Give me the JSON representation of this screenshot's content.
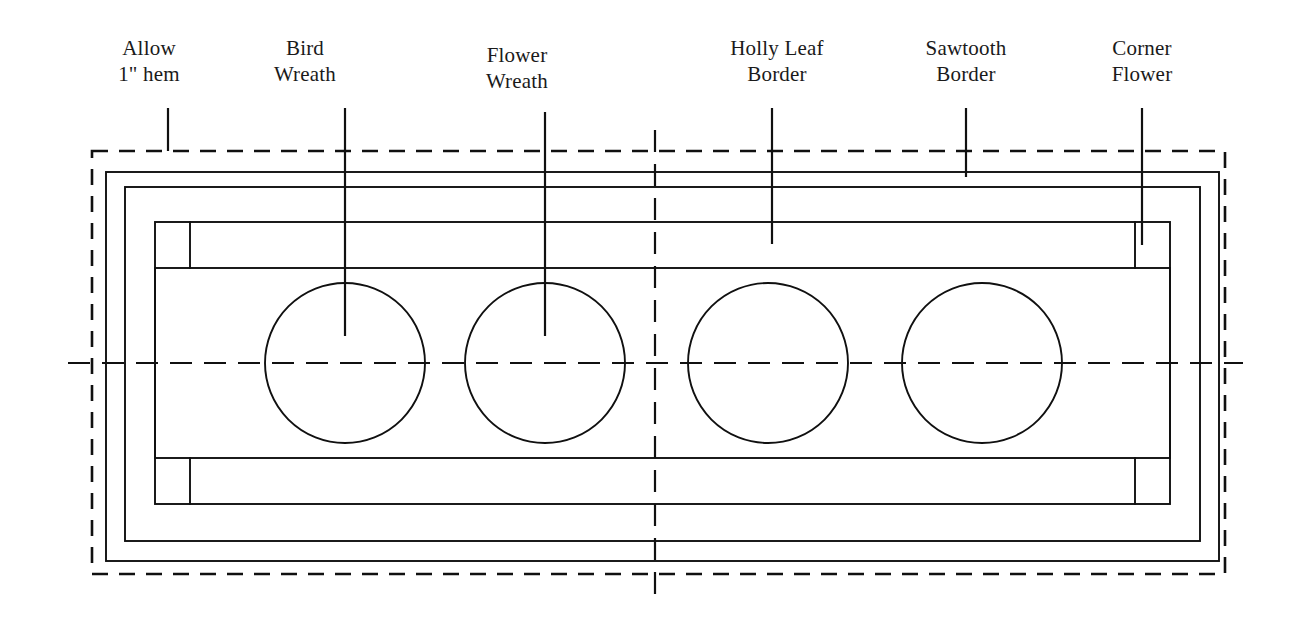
{
  "figure": {
    "kind": "quilt-layout-diagram",
    "background_color": "#ffffff",
    "ink_color": "#101010",
    "width": 1310,
    "height": 619
  },
  "callouts": [
    {
      "id": "allow-hem",
      "line1": "Allow",
      "line2": "1\" hem",
      "text_x": 149,
      "text_y": 55,
      "leader_x": 168,
      "leader_top": 108,
      "leader_bottom": 151
    },
    {
      "id": "bird-wreath",
      "line1": "Bird",
      "line2": "Wreath",
      "text_x": 305,
      "text_y": 55,
      "leader_x": 345,
      "leader_top": 108,
      "leader_bottom": 336
    },
    {
      "id": "flower-wreath",
      "line1": "Flower",
      "line2": "Wreath",
      "text_x": 517,
      "text_y": 62,
      "leader_x": 545,
      "leader_top": 112,
      "leader_bottom": 336
    },
    {
      "id": "holly-leaf-border",
      "line1": "Holly Leaf",
      "line2": "Border",
      "text_x": 777,
      "text_y": 55,
      "leader_x": 772,
      "leader_top": 108,
      "leader_bottom": 244
    },
    {
      "id": "sawtooth-border",
      "line1": "Sawtooth",
      "line2": "Border",
      "text_x": 966,
      "text_y": 55,
      "leader_x": 966,
      "leader_top": 108,
      "leader_bottom": 177
    },
    {
      "id": "corner-flower",
      "line1": "Corner",
      "line2": "Flower",
      "text_x": 1142,
      "text_y": 55,
      "leader_x": 1142,
      "leader_top": 108,
      "leader_bottom": 245
    }
  ],
  "hem_border": {
    "name": "allow-1-inch-hem-dashed-border",
    "x": 92,
    "y": 151,
    "width": 1133,
    "height": 423
  },
  "rectangles": [
    {
      "id": "outer-binding",
      "x": 106,
      "y": 172,
      "width": 1113,
      "height": 389
    },
    {
      "id": "sawtooth-border-band",
      "x": 125,
      "y": 187,
      "width": 1075,
      "height": 354
    },
    {
      "id": "holly-leaf-border-band",
      "x": 155,
      "y": 222,
      "width": 1015,
      "height": 282
    }
  ],
  "inner_panel": {
    "id": "center-panel",
    "x": 155,
    "y": 268,
    "width": 1015,
    "height": 190
  },
  "corner_blocks": [
    {
      "id": "corner-flower-top-left",
      "x": 155,
      "y": 222,
      "size_w": 35,
      "size_h": 46
    },
    {
      "id": "corner-flower-top-right",
      "x": 1135,
      "y": 222,
      "size_w": 35,
      "size_h": 46
    },
    {
      "id": "corner-flower-bottom-left",
      "x": 155,
      "y": 458,
      "size_w": 35,
      "size_h": 46
    },
    {
      "id": "corner-flower-bottom-right",
      "x": 1135,
      "y": 458,
      "size_w": 35,
      "size_h": 46
    }
  ],
  "wreath_circles": [
    {
      "id": "bird-wreath-circle-1",
      "cx": 345,
      "cy": 363,
      "r": 80
    },
    {
      "id": "flower-wreath-circle-2",
      "cx": 545,
      "cy": 363,
      "r": 80
    },
    {
      "id": "wreath-circle-3",
      "cx": 768,
      "cy": 363,
      "r": 80
    },
    {
      "id": "wreath-circle-4",
      "cx": 982,
      "cy": 363,
      "r": 80
    }
  ],
  "center_lines": [
    {
      "id": "horizontal-center-line",
      "x1": 68,
      "y1": 363,
      "x2": 1243,
      "y2": 363
    },
    {
      "id": "vertical-center-line",
      "x1": 655,
      "y1": 130,
      "x2": 655,
      "y2": 595
    }
  ]
}
